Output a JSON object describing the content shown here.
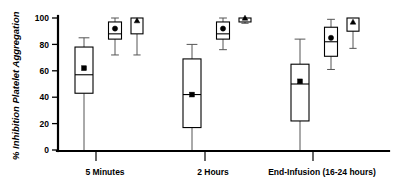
{
  "chart_data": {
    "type": "box",
    "title": "",
    "xlabel": "",
    "ylabel": "% Inhibition Platelet Aggregation",
    "ylim": [
      0,
      100
    ],
    "yticks": [
      0,
      20,
      40,
      60,
      80,
      100
    ],
    "ytick_labels": [
      "0",
      "20",
      "40",
      "60",
      "80",
      "100"
    ],
    "grid": false,
    "legend": "none",
    "categories": [
      "5 Minutes",
      "2 Hours",
      "End-Infusion (16-24 hours)"
    ],
    "series": [
      {
        "name": "box-1",
        "marker": "square",
        "boxes": [
          {
            "group": "5 Minutes",
            "whisker_low": 0,
            "q1": 43,
            "median": 57,
            "q3": 78,
            "whisker_high": 85,
            "mean": 62
          },
          {
            "group": "2 Hours",
            "whisker_low": 0,
            "q1": 17,
            "median": 42,
            "q3": 69,
            "whisker_high": 80,
            "mean": 42
          },
          {
            "group": "End-Infusion (16-24 hours)",
            "whisker_low": 0,
            "q1": 22,
            "median": 50,
            "q3": 65,
            "whisker_high": 84,
            "mean": 52
          }
        ]
      },
      {
        "name": "box-2",
        "marker": "circle",
        "boxes": [
          {
            "group": "5 Minutes",
            "whisker_low": 72,
            "q1": 84,
            "median": 88,
            "q3": 97,
            "whisker_high": 100,
            "mean": 92
          },
          {
            "group": "2 Hours",
            "whisker_low": 76,
            "q1": 84,
            "median": 88,
            "q3": 97,
            "whisker_high": 100,
            "mean": 92
          },
          {
            "group": "End-Infusion (16-24 hours)",
            "whisker_low": 61,
            "q1": 71,
            "median": 82,
            "q3": 93,
            "whisker_high": 99,
            "mean": 85
          }
        ]
      },
      {
        "name": "box-3",
        "marker": "triangle",
        "boxes": [
          {
            "group": "5 Minutes",
            "whisker_low": 72,
            "q1": 88,
            "median": null,
            "q3": 100,
            "whisker_high": 100,
            "mean": 98
          },
          {
            "group": "2 Hours",
            "whisker_low": 96,
            "q1": 97,
            "median": null,
            "q3": 100,
            "whisker_high": 100,
            "mean": 100
          },
          {
            "group": "End-Infusion (16-24 hours)",
            "whisker_low": 77,
            "q1": 90,
            "median": null,
            "q3": 100,
            "whisker_high": 100,
            "mean": 97
          }
        ]
      }
    ]
  },
  "axes": {
    "y_title": "% Inhibition Platelet Aggregation",
    "y_tick_0": "0",
    "y_tick_20": "20",
    "y_tick_40": "40",
    "y_tick_60": "60",
    "y_tick_80": "80",
    "y_tick_100": "100"
  },
  "categories": {
    "c0": "5 Minutes",
    "c1": "2 Hours",
    "c2": "End-Infusion (16-24 hours)"
  },
  "colors": {
    "axis": "#000000",
    "box_stroke": "#000000",
    "box_fill": "#ffffff",
    "whisker": "#555555",
    "marker": "#000000",
    "background": "#ffffff"
  }
}
